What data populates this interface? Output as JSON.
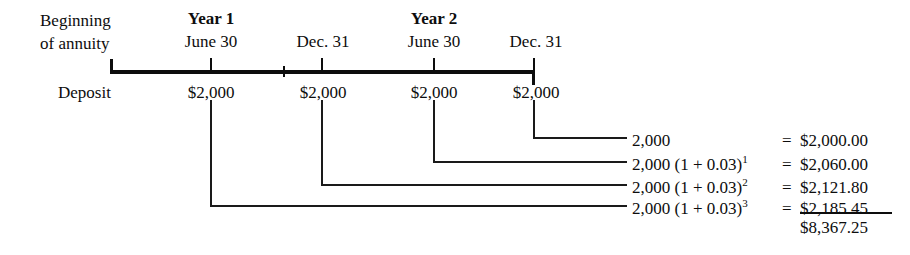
{
  "diagram": {
    "left_labels": {
      "beginning_line1": "Beginning",
      "beginning_line2": "of annuity",
      "deposit": "Deposit"
    },
    "periods": [
      {
        "year_label": "Year 1",
        "date_label": "June 30",
        "deposit": "$2,000"
      },
      {
        "year_label": "",
        "date_label": "Dec. 31",
        "deposit": "$2,000"
      },
      {
        "year_label": "Year 2",
        "date_label": "June 30",
        "deposit": "$2,000"
      },
      {
        "year_label": "",
        "date_label": "Dec. 31",
        "deposit": "$2,000"
      }
    ],
    "formulas": [
      {
        "expression": "2,000",
        "exponent": "",
        "equals": "=",
        "value": "$2,000.00"
      },
      {
        "expression": "2,000 (1 + 0.03)",
        "exponent": "1",
        "equals": "=",
        "value": "$2,060.00"
      },
      {
        "expression": "2,000 (1 + 0.03)",
        "exponent": "2",
        "equals": "=",
        "value": "$2,121.80"
      },
      {
        "expression": "2,000 (1 + 0.03)",
        "exponent": "3",
        "equals": "=",
        "value": "$2,185.45"
      }
    ],
    "total": "$8,367.25",
    "colors": {
      "ink": "#0d0d0d",
      "line": "#1a1a1a",
      "background": "#ffffff"
    }
  }
}
